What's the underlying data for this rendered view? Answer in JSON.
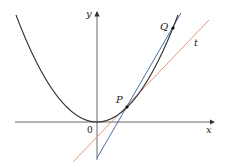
{
  "diagram": {
    "labels": {
      "y_axis": "y",
      "x_axis": "x",
      "origin": "0",
      "point_p": "P",
      "point_q": "Q",
      "tangent": "t"
    },
    "colors": {
      "axes": "#555555",
      "curve": "#333333",
      "secant": "#4a6fa5",
      "tangent": "#e8957a",
      "points": "#111111"
    },
    "geometry": {
      "vertex": [
        97,
        122
      ],
      "parabola_coefficient": 0.0163,
      "P": [
        127,
        107
      ],
      "Q": [
        173,
        28
      ],
      "secant_line": [
        [
          97,
          158
        ],
        [
          181,
          13
        ]
      ],
      "tangent_line": [
        [
          73,
          162
        ],
        [
          209,
          20
        ]
      ]
    }
  }
}
